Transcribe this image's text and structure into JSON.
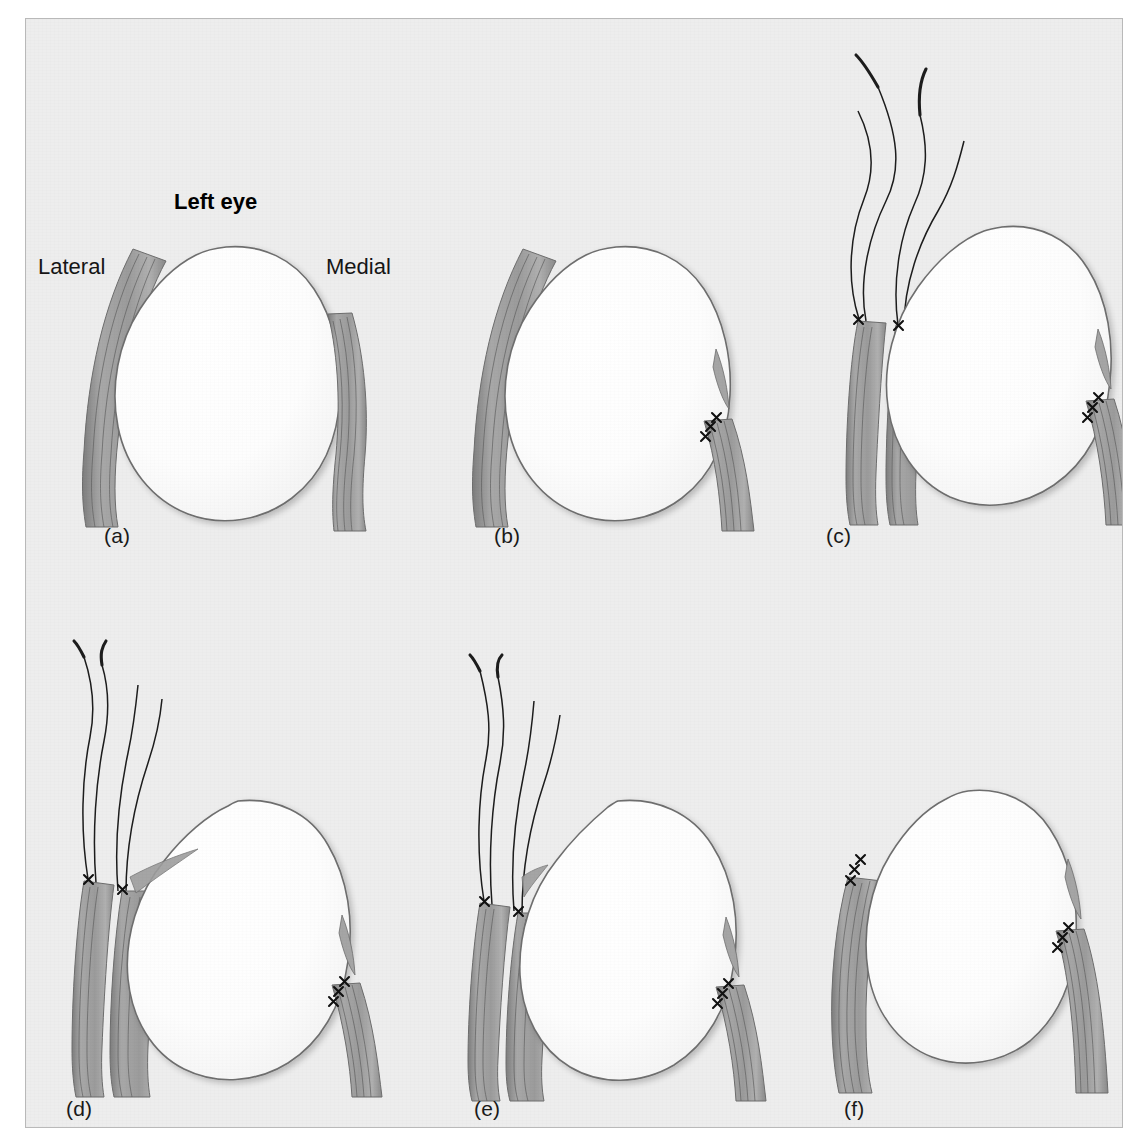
{
  "figure": {
    "title": "Left eye",
    "orientation_left": "Lateral",
    "orientation_right": "Medial",
    "background_color": "#ededed",
    "frame_border_color": "#b9b9b9",
    "globe_fill": "#fdfdfd",
    "globe_stroke": "#6e6e6e",
    "muscle_fill": "#9a9a9a",
    "muscle_fiber": "#5d5d5d",
    "suture_color": "#1a1a1a",
    "knot_color": "#111111",
    "panels": [
      {
        "id": "a",
        "caption": "(a)",
        "description": "Normal left eye globe with lateral and medial rectus muscles attached at their original insertions",
        "lateral_muscle_attached": "yes",
        "medial_muscle_attached": "yes",
        "sutures_visible": "none",
        "knot_groups": 0
      },
      {
        "id": "b",
        "caption": "(b)",
        "description": "Medial rectus disinserted and reattached posteriorly with three suture knots; small stump remains at original insertion",
        "lateral_muscle_attached": "yes",
        "medial_muscle_attached": "resutured",
        "sutures_visible": "knots only",
        "knot_groups": 1
      },
      {
        "id": "c",
        "caption": "(c)",
        "description": "Lateral rectus secured with two double-armed sutures; four long needle threads curve upward away from the globe",
        "lateral_muscle_attached": "sutured, still on globe",
        "medial_muscle_attached": "resutured",
        "sutures_visible": "four threads",
        "knot_groups": 2,
        "thread_count": 4
      },
      {
        "id": "d",
        "caption": "(d)",
        "description": "Lateral rectus fully disinserted and retracted away from the globe, held by four suture threads; globe rotates medially",
        "lateral_muscle_attached": "detached",
        "medial_muscle_attached": "resutured",
        "sutures_visible": "four threads",
        "knot_groups": 2,
        "thread_count": 4
      },
      {
        "id": "e",
        "caption": "(e)",
        "description": "Globe repositioned toward the detached lateral rectus; muscle still suspended on its four suture threads",
        "lateral_muscle_attached": "detached",
        "medial_muscle_attached": "resutured",
        "sutures_visible": "four threads",
        "knot_groups": 2,
        "thread_count": 4
      },
      {
        "id": "f",
        "caption": "(f)",
        "description": "Final result: lateral rectus reattached anteriorly and medial rectus recessed, both fixed with suture knots",
        "lateral_muscle_attached": "resutured",
        "medial_muscle_attached": "resutured",
        "sutures_visible": "knots only",
        "knot_groups": 2
      }
    ]
  }
}
